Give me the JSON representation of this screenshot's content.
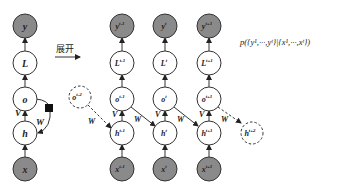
{
  "diagram": {
    "type": "rnn-unfolding",
    "unfold_label": "展开",
    "formula": "p({y¹,···,yᵗ}|{x¹,···,xᵗ})",
    "colors": {
      "observed_fill": "#8a8a8a",
      "hidden_fill": "#ffffff",
      "stroke": "#333333",
      "self_loop_marker": "#111111"
    },
    "folded": {
      "nodes": [
        {
          "id": "y",
          "label": "y",
          "observed": true
        },
        {
          "id": "L",
          "label": "L",
          "observed": false
        },
        {
          "id": "o",
          "label": "o",
          "observed": false
        },
        {
          "id": "h",
          "label": "h",
          "observed": false
        },
        {
          "id": "x",
          "label": "x",
          "observed": true
        }
      ],
      "edge_labels": {
        "V": "V",
        "W": "W"
      }
    },
    "unrolled": {
      "columns": [
        {
          "y": "y",
          "y_sup": "t-1",
          "L": "L",
          "L_sup": "t-1",
          "o": "o",
          "o_sup": "t-1",
          "h": "h",
          "h_sup": "t-1",
          "x": "x",
          "x_sup": "t-1"
        },
        {
          "y": "y",
          "y_sup": "t",
          "L": "L",
          "L_sup": "t",
          "o": "o",
          "o_sup": "t",
          "h": "h",
          "h_sup": "t",
          "x": "x",
          "x_sup": "t"
        },
        {
          "y": "y",
          "y_sup": "t+1",
          "L": "L",
          "L_sup": "t+1",
          "o": "o",
          "o_sup": "t+1",
          "h": "h",
          "h_sup": "t+1",
          "x": "x",
          "x_sup": "t+1"
        }
      ],
      "prev_output": {
        "label": "o",
        "sup": "t-2"
      },
      "next_hidden": {
        "label": "h",
        "sup": "t+2"
      },
      "edge_labels": {
        "V": "V",
        "W": "W"
      }
    }
  }
}
